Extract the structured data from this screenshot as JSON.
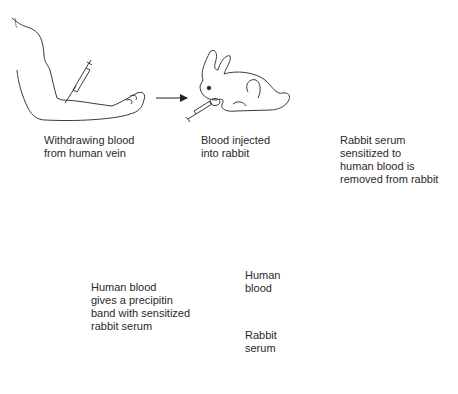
{
  "diagram": {
    "type": "process-flow",
    "steps": [
      {
        "id": "withdraw",
        "label_lines": [
          "Withdrawing blood",
          "from human vein"
        ]
      },
      {
        "id": "inject",
        "label_lines": [
          "Blood injected",
          "into rabbit"
        ]
      },
      {
        "id": "remove",
        "label_lines": [
          "Rabbit serum",
          "sensitized to",
          "human blood is",
          "removed from rabbit"
        ]
      }
    ],
    "tube": {
      "layers": [
        {
          "id": "upper",
          "label_lines": [
            "Human",
            "blood"
          ]
        },
        {
          "id": "lower",
          "label_lines": [
            "Rabbit",
            "serum"
          ]
        }
      ],
      "band_label_lines": [
        "Human blood",
        "gives a precipitin",
        "band with sensitized",
        "rabbit serum"
      ]
    },
    "colors": {
      "line": "#3a3a3a",
      "fluid": "#c8c8c8",
      "band": "#ffffff"
    }
  }
}
